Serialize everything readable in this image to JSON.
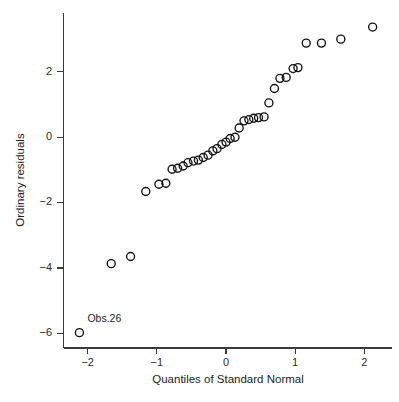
{
  "figure": {
    "width": 399,
    "height": 402,
    "background_color": "#ffffff",
    "marker_color": "#111111",
    "axis_color": "#3a3a3a",
    "text_color": "#1d1d1d"
  },
  "chart_data": {
    "type": "scatter",
    "title": "",
    "subtitle": "",
    "xlabel": "Quantiles of Standard Normal",
    "ylabel": "Ordinary residuals",
    "xlim": [
      -2.35,
      2.4
    ],
    "ylim": [
      -6.45,
      3.8
    ],
    "xticks": [
      -2,
      -1,
      0,
      1,
      2
    ],
    "xtick_labels": [
      "−2",
      "−1",
      "0",
      "1",
      "2"
    ],
    "yticks": [
      2,
      0,
      -2,
      -4,
      -6
    ],
    "ytick_labels": [
      "2",
      "0",
      "−2",
      "−4",
      "−6"
    ],
    "grid": false,
    "legend": false,
    "legend_position": "none",
    "marker": "open-circle",
    "marker_size": 4.0,
    "x": [
      -2.12,
      -1.66,
      -1.38,
      -1.16,
      -0.97,
      -0.87,
      -0.78,
      -0.7,
      -0.62,
      -0.55,
      -0.47,
      -0.4,
      -0.33,
      -0.26,
      -0.19,
      -0.13,
      -0.06,
      0.0,
      0.06,
      0.13,
      0.19,
      0.26,
      0.33,
      0.4,
      0.47,
      0.55,
      0.62,
      0.7,
      0.78,
      0.87,
      0.97,
      1.04,
      1.16,
      1.38,
      1.66,
      2.12
    ],
    "y": [
      -5.98,
      -3.87,
      -3.65,
      -1.66,
      -1.44,
      -1.41,
      -0.98,
      -0.95,
      -0.88,
      -0.78,
      -0.73,
      -0.7,
      -0.62,
      -0.55,
      -0.42,
      -0.35,
      -0.22,
      -0.15,
      -0.04,
      0.0,
      0.28,
      0.5,
      0.54,
      0.58,
      0.6,
      0.62,
      1.05,
      1.49,
      1.8,
      1.83,
      2.1,
      2.13,
      2.88,
      2.88,
      3.0,
      3.37
    ],
    "annotations": [
      {
        "label": "Obs.26",
        "point_x": -2.12,
        "point_y": -5.98,
        "offset_x": 8,
        "offset_y": -11
      }
    ]
  },
  "axes": {
    "y_axis_title": "Ordinary residuals",
    "x_axis_title": "Quantiles of Standard Normal"
  }
}
